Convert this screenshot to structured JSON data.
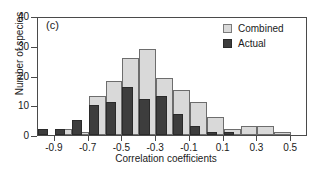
{
  "panel": {
    "label": "(c)"
  },
  "legend": {
    "position": "top-right",
    "entries": [
      {
        "label": "Combined",
        "color": "#d9d9d9",
        "swatch": "combined"
      },
      {
        "label": "Actual",
        "color": "#3d3d3d",
        "swatch": "actual"
      }
    ]
  },
  "axes": {
    "y": {
      "title": "Number of species",
      "ticks": [
        0,
        10,
        20,
        30,
        40
      ],
      "min": 0,
      "max": 40
    },
    "x": {
      "title": "Correlation coefficients",
      "ticks": [
        -0.9,
        -0.7,
        -0.5,
        -0.3,
        -0.1,
        0.1,
        0.3,
        0.5
      ],
      "tick_labels": [
        "-0.9",
        "-0.7",
        "-0.5",
        "-0.3",
        "-0.1",
        "0.1",
        "0.3",
        "0.5"
      ],
      "min": -1.0,
      "max": 0.6
    }
  },
  "chart_data": {
    "type": "bar",
    "title": "(c)",
    "xlabel": "Correlation coefficients",
    "ylabel": "Number of species",
    "xlim": [
      -1.0,
      0.6
    ],
    "ylim": [
      0,
      40
    ],
    "grid": false,
    "legend_position": "top-right",
    "bin_width": 0.1,
    "categories": [
      "-0.95",
      "-0.85",
      "-0.75",
      "-0.65",
      "-0.55",
      "-0.45",
      "-0.35",
      "-0.25",
      "-0.15",
      "-0.05",
      "0.05",
      "0.15",
      "0.25",
      "0.35",
      "0.45",
      "0.55"
    ],
    "series": [
      {
        "name": "Combined",
        "color": "#d9d9d9",
        "values": [
          0,
          2,
          1,
          13,
          18,
          26,
          29,
          19,
          15,
          11,
          6,
          2,
          3,
          3,
          1,
          0
        ]
      },
      {
        "name": "Actual",
        "color": "#3d3d3d",
        "values": [
          2,
          2,
          5,
          10,
          11,
          16,
          12,
          13,
          7,
          3,
          1,
          1,
          0,
          0,
          0,
          0
        ]
      }
    ]
  }
}
